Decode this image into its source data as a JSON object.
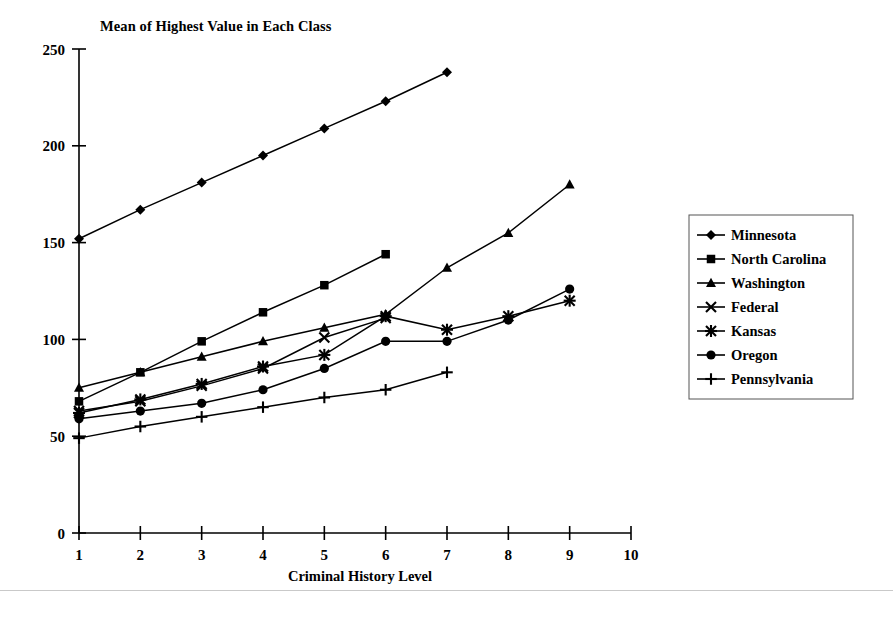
{
  "chart_data": {
    "type": "line",
    "title": "Mean of Highest Value in Each Class",
    "xlabel": "Criminal History Level",
    "ylabel": "",
    "xlim": [
      1,
      10
    ],
    "ylim": [
      0,
      250
    ],
    "grid": false,
    "legend_position": "right",
    "xticks": [
      "1",
      "2",
      "3",
      "4",
      "5",
      "6",
      "7",
      "8",
      "9",
      "10"
    ],
    "yticks": [
      "0",
      "50",
      "100",
      "150",
      "200",
      "250"
    ],
    "series": [
      {
        "name": "Minnesota",
        "marker": "diamond",
        "x": [
          1,
          2,
          3,
          4,
          5,
          6,
          7
        ],
        "values": [
          152,
          167,
          181,
          195,
          209,
          223,
          238
        ]
      },
      {
        "name": "North Carolina",
        "marker": "square",
        "x": [
          1,
          2,
          3,
          4,
          5,
          6
        ],
        "values": [
          68,
          83,
          99,
          114,
          128,
          144
        ]
      },
      {
        "name": "Washington",
        "marker": "triangle",
        "x": [
          1,
          2,
          3,
          4,
          5,
          6,
          7,
          8,
          9
        ],
        "values": [
          75,
          83,
          91,
          99,
          106,
          113,
          137,
          155,
          180
        ]
      },
      {
        "name": "Federal",
        "marker": "x",
        "x": [
          1,
          2,
          3,
          4,
          5,
          6
        ],
        "values": [
          63,
          68,
          76,
          85,
          101,
          111
        ]
      },
      {
        "name": "Kansas",
        "marker": "star",
        "x": [
          1,
          2,
          3,
          4,
          5,
          6,
          7,
          8,
          9
        ],
        "values": [
          62,
          69,
          77,
          86,
          92,
          112,
          105,
          112,
          120
        ]
      },
      {
        "name": "Oregon",
        "marker": "circle",
        "x": [
          1,
          2,
          3,
          4,
          5,
          6,
          7,
          8,
          9
        ],
        "values": [
          59,
          63,
          67,
          74,
          85,
          99,
          99,
          110,
          126
        ]
      },
      {
        "name": "Pennsylvania",
        "marker": "plus",
        "x": [
          1,
          2,
          3,
          4,
          5,
          6,
          7
        ],
        "values": [
          49,
          55,
          60,
          65,
          70,
          74,
          83
        ]
      }
    ]
  },
  "legend": {
    "items": [
      {
        "label": "Minnesota"
      },
      {
        "label": "North Carolina"
      },
      {
        "label": "Washington"
      },
      {
        "label": "Federal"
      },
      {
        "label": "Kansas"
      },
      {
        "label": "Oregon"
      },
      {
        "label": "Pennsylvania"
      }
    ]
  },
  "colors": {
    "ink": "#000000",
    "background": "#ffffff",
    "rule": "#c9c9c9"
  }
}
